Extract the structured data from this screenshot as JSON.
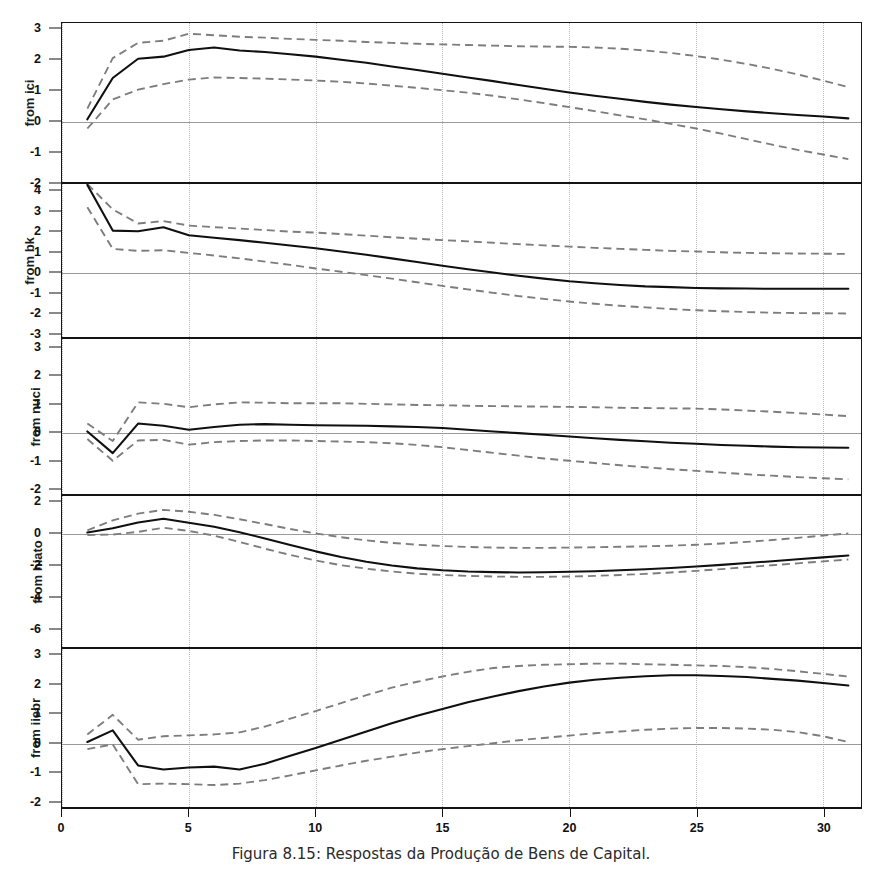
{
  "caption": "Figura 8.15: Respostas da Produção de Bens de Capital.",
  "axis": {
    "x_ticks": [
      0,
      5,
      10,
      15,
      20,
      25,
      30
    ],
    "x_tick_labels": [
      "0",
      "5",
      "10",
      "15",
      "20",
      "25",
      "30"
    ],
    "x_min": 0,
    "x_max": 31.5
  },
  "style": {
    "response_color": "#101010",
    "band_color": "#7d7d7d",
    "grid_color": "#b8b8b8",
    "zero_color": "#9a9a9a",
    "frame_color": "#141414"
  },
  "chart_data": {
    "type": "line",
    "title": "Figura 8.15: Respostas da Produção de Bens de Capital.",
    "xlabel": "",
    "ylabel": "",
    "grid": true,
    "legend": "none",
    "x": [
      1,
      2,
      3,
      4,
      5,
      6,
      7,
      8,
      9,
      10,
      11,
      12,
      13,
      14,
      15,
      16,
      17,
      18,
      19,
      20,
      21,
      22,
      23,
      24,
      25,
      26,
      27,
      28,
      29,
      30,
      31
    ],
    "panels": [
      {
        "label": "from ici",
        "ylim": [
          -2.0,
          3.2
        ],
        "yticks": [
          3,
          2,
          1,
          0,
          -1,
          -2
        ],
        "ytick_labels": [
          "3",
          "2",
          "1",
          "0",
          "-1",
          "-2"
        ],
        "series": [
          {
            "name": "response",
            "style": "solid",
            "values": [
              0.05,
              1.4,
              2.03,
              2.1,
              2.32,
              2.4,
              2.3,
              2.25,
              2.18,
              2.1,
              2.0,
              1.9,
              1.78,
              1.66,
              1.54,
              1.42,
              1.3,
              1.17,
              1.05,
              0.93,
              0.82,
              0.72,
              0.62,
              0.53,
              0.45,
              0.38,
              0.31,
              0.25,
              0.19,
              0.14,
              0.08
            ]
          },
          {
            "name": "upper_band",
            "style": "dashed",
            "values": [
              0.4,
              2.05,
              2.55,
              2.62,
              2.85,
              2.8,
              2.75,
              2.72,
              2.68,
              2.65,
              2.62,
              2.58,
              2.55,
              2.52,
              2.5,
              2.48,
              2.46,
              2.44,
              2.43,
              2.42,
              2.4,
              2.36,
              2.3,
              2.22,
              2.12,
              2.0,
              1.86,
              1.7,
              1.52,
              1.32,
              1.1
            ]
          },
          {
            "name": "lower_band",
            "style": "dashed",
            "values": [
              -0.25,
              0.7,
              1.02,
              1.2,
              1.35,
              1.42,
              1.4,
              1.38,
              1.35,
              1.32,
              1.28,
              1.22,
              1.15,
              1.08,
              1.0,
              0.92,
              0.82,
              0.7,
              0.58,
              0.45,
              0.32,
              0.18,
              0.05,
              -0.1,
              -0.25,
              -0.42,
              -0.6,
              -0.78,
              -0.95,
              -1.1,
              -1.25
            ]
          }
        ]
      },
      {
        "label": "from bk",
        "ylim": [
          -3.2,
          4.35
        ],
        "yticks": [
          4,
          3,
          2,
          1,
          0,
          -1,
          -2,
          -3
        ],
        "ytick_labels": [
          "4",
          "3",
          "2",
          "1",
          "0",
          "-1",
          "-2",
          "-3"
        ],
        "series": [
          {
            "name": "response",
            "style": "solid",
            "values": [
              4.3,
              2.05,
              2.02,
              2.22,
              1.82,
              1.7,
              1.58,
              1.45,
              1.32,
              1.18,
              1.02,
              0.86,
              0.68,
              0.5,
              0.32,
              0.14,
              -0.02,
              -0.18,
              -0.32,
              -0.45,
              -0.55,
              -0.63,
              -0.7,
              -0.74,
              -0.78,
              -0.8,
              -0.81,
              -0.82,
              -0.82,
              -0.82,
              -0.82
            ]
          },
          {
            "name": "upper_band",
            "style": "dashed",
            "values": [
              4.35,
              3.1,
              2.4,
              2.52,
              2.3,
              2.22,
              2.15,
              2.08,
              2.0,
              1.95,
              1.88,
              1.8,
              1.72,
              1.65,
              1.58,
              1.52,
              1.45,
              1.38,
              1.32,
              1.26,
              1.2,
              1.15,
              1.1,
              1.05,
              1.02,
              0.98,
              0.95,
              0.93,
              0.92,
              0.91,
              0.9
            ]
          },
          {
            "name": "lower_band",
            "style": "dashed",
            "values": [
              3.2,
              1.15,
              1.05,
              1.08,
              0.95,
              0.82,
              0.68,
              0.52,
              0.36,
              0.18,
              0.02,
              -0.15,
              -0.32,
              -0.5,
              -0.68,
              -0.85,
              -1.02,
              -1.18,
              -1.32,
              -1.45,
              -1.56,
              -1.66,
              -1.74,
              -1.82,
              -1.88,
              -1.93,
              -1.97,
              -2.0,
              -2.02,
              -2.03,
              -2.04
            ]
          }
        ]
      },
      {
        "label": "from nuci",
        "ylim": [
          -2.2,
          3.3
        ],
        "yticks": [
          3,
          2,
          1,
          0,
          -1,
          -2
        ],
        "ytick_labels": [
          "3",
          "2",
          "1",
          "0",
          "-1",
          "-2"
        ],
        "series": [
          {
            "name": "response",
            "style": "solid",
            "values": [
              0.02,
              -0.75,
              0.3,
              0.22,
              0.08,
              0.18,
              0.26,
              0.28,
              0.26,
              0.24,
              0.23,
              0.22,
              0.2,
              0.18,
              0.14,
              0.08,
              0.02,
              -0.04,
              -0.1,
              -0.16,
              -0.22,
              -0.28,
              -0.33,
              -0.38,
              -0.42,
              -0.46,
              -0.49,
              -0.52,
              -0.54,
              -0.55,
              -0.56
            ]
          },
          {
            "name": "upper_band",
            "style": "dashed",
            "values": [
              0.3,
              -0.32,
              1.05,
              1.0,
              0.88,
              0.98,
              1.05,
              1.04,
              1.02,
              1.02,
              1.02,
              1.0,
              0.98,
              0.96,
              0.95,
              0.93,
              0.92,
              0.91,
              0.9,
              0.89,
              0.88,
              0.86,
              0.85,
              0.84,
              0.83,
              0.8,
              0.76,
              0.72,
              0.67,
              0.62,
              0.56
            ]
          },
          {
            "name": "lower_band",
            "style": "dashed",
            "values": [
              -0.25,
              -1.02,
              -0.3,
              -0.28,
              -0.45,
              -0.36,
              -0.32,
              -0.3,
              -0.3,
              -0.32,
              -0.34,
              -0.36,
              -0.4,
              -0.46,
              -0.54,
              -0.64,
              -0.74,
              -0.84,
              -0.94,
              -1.02,
              -1.1,
              -1.18,
              -1.25,
              -1.32,
              -1.38,
              -1.44,
              -1.5,
              -1.55,
              -1.6,
              -1.64,
              -1.68
            ]
          }
        ]
      },
      {
        "label": "from hiato",
        "ylim": [
          -7.2,
          2.4
        ],
        "yticks": [
          2,
          0,
          -2,
          -4,
          -6
        ],
        "ytick_labels": [
          "2",
          "0",
          "-2",
          "-4",
          "-6"
        ],
        "series": [
          {
            "name": "response",
            "style": "solid",
            "values": [
              0.08,
              0.35,
              0.72,
              0.95,
              0.7,
              0.45,
              0.1,
              -0.3,
              -0.72,
              -1.12,
              -1.48,
              -1.78,
              -2.02,
              -2.2,
              -2.32,
              -2.4,
              -2.44,
              -2.46,
              -2.45,
              -2.42,
              -2.38,
              -2.32,
              -2.26,
              -2.18,
              -2.08,
              -1.98,
              -1.86,
              -1.75,
              -1.62,
              -1.5,
              -1.38
            ]
          },
          {
            "name": "upper_band",
            "style": "dashed",
            "values": [
              0.22,
              0.85,
              1.28,
              1.52,
              1.4,
              1.2,
              0.92,
              0.62,
              0.3,
              0.02,
              -0.22,
              -0.42,
              -0.58,
              -0.7,
              -0.78,
              -0.84,
              -0.88,
              -0.9,
              -0.9,
              -0.88,
              -0.86,
              -0.83,
              -0.8,
              -0.76,
              -0.7,
              -0.62,
              -0.52,
              -0.4,
              -0.26,
              -0.12,
              0.02
            ]
          },
          {
            "name": "lower_band",
            "style": "dashed",
            "values": [
              -0.08,
              -0.05,
              0.12,
              0.38,
              0.18,
              -0.12,
              -0.52,
              -0.95,
              -1.35,
              -1.7,
              -2.0,
              -2.22,
              -2.4,
              -2.54,
              -2.62,
              -2.68,
              -2.72,
              -2.74,
              -2.74,
              -2.72,
              -2.68,
              -2.62,
              -2.55,
              -2.46,
              -2.36,
              -2.25,
              -2.12,
              -2.0,
              -1.88,
              -1.76,
              -1.64
            ]
          }
        ]
      },
      {
        "label": "from iiebr",
        "ylim": [
          -2.2,
          3.2
        ],
        "yticks": [
          3,
          2,
          1,
          0,
          -1,
          -2
        ],
        "ytick_labels": [
          "3",
          "2",
          "1",
          "0",
          "-1",
          "-2"
        ],
        "series": [
          {
            "name": "response",
            "style": "solid",
            "values": [
              0.02,
              0.42,
              -0.78,
              -0.92,
              -0.85,
              -0.82,
              -0.92,
              -0.72,
              -0.45,
              -0.18,
              0.1,
              0.38,
              0.66,
              0.92,
              1.15,
              1.38,
              1.58,
              1.76,
              1.92,
              2.05,
              2.15,
              2.22,
              2.27,
              2.3,
              2.3,
              2.28,
              2.24,
              2.18,
              2.12,
              2.04,
              1.95
            ]
          },
          {
            "name": "upper_band",
            "style": "dashed",
            "values": [
              0.28,
              0.95,
              0.1,
              0.22,
              0.25,
              0.28,
              0.35,
              0.55,
              0.82,
              1.08,
              1.35,
              1.62,
              1.88,
              2.08,
              2.26,
              2.42,
              2.55,
              2.62,
              2.66,
              2.68,
              2.7,
              2.7,
              2.68,
              2.66,
              2.64,
              2.62,
              2.58,
              2.52,
              2.44,
              2.35,
              2.26
            ]
          },
          {
            "name": "lower_band",
            "style": "dashed",
            "values": [
              -0.22,
              -0.06,
              -1.42,
              -1.4,
              -1.42,
              -1.45,
              -1.4,
              -1.28,
              -1.12,
              -0.95,
              -0.78,
              -0.62,
              -0.48,
              -0.34,
              -0.22,
              -0.12,
              -0.02,
              0.08,
              0.16,
              0.24,
              0.32,
              0.38,
              0.44,
              0.48,
              0.5,
              0.5,
              0.48,
              0.44,
              0.36,
              0.22,
              0.02
            ]
          }
        ]
      }
    ]
  }
}
